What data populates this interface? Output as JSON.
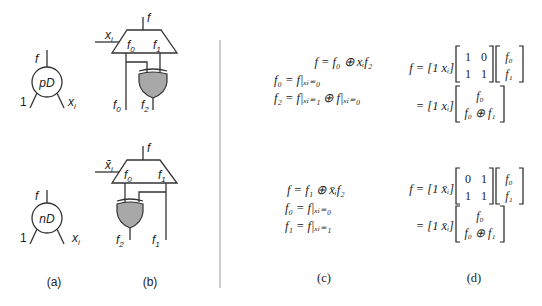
{
  "figure": {
    "panel_labels": {
      "a": "(a)",
      "b": "(b)",
      "c": "(c)",
      "d": "(d)"
    },
    "colors": {
      "gate_fill": "#a8a8a8",
      "line": "#333333",
      "divider": "#999999"
    },
    "panel_a": {
      "top_node": {
        "label": "pD",
        "output": "f",
        "left_input": "1",
        "right_input": "x",
        "right_input_sub": "i"
      },
      "bottom_node": {
        "label": "nD",
        "output": "f",
        "left_input": "1",
        "right_input": "x",
        "right_input_sub": "i"
      }
    },
    "panel_b": {
      "top": {
        "output": "f",
        "select": "x",
        "select_sub": "i",
        "mux_in0": "f",
        "mux_in0_sub": "0",
        "mux_in1": "f",
        "mux_in1_sub": "1",
        "out_left": "f",
        "out_left_sub": "0",
        "out_right": "f",
        "out_right_sub": "2",
        "gate": "xor"
      },
      "bottom": {
        "output": "f",
        "select": "x̄",
        "select_sub": "i",
        "mux_in0": "f",
        "mux_in0_sub": "0",
        "mux_in1": "f",
        "mux_in1_sub": "1",
        "out_left": "f",
        "out_left_sub": "2",
        "out_right": "f",
        "out_right_sub": "1",
        "gate": "xor"
      }
    },
    "panel_c": {
      "top": [
        "f = f₀ ⊕ xᵢf₂",
        "f₀ = f|ₓᵢ₌₀",
        "f₂ = f|ₓᵢ₌₁ ⊕ f|ₓᵢ₌₀"
      ],
      "bottom": [
        "f = f₁ ⊕ x̄ᵢf₂",
        "f₀ = f|ₓᵢ₌₀",
        "f₁ = f|ₓᵢ₌₁"
      ]
    },
    "panel_d": {
      "top": {
        "lhs": "f = [1 xᵢ]",
        "matrix": [
          [
            "1",
            "0"
          ],
          [
            "1",
            "1"
          ]
        ],
        "vector": [
          "f₀",
          "f₁"
        ],
        "line2_lhs": "= [1 xᵢ]",
        "result": [
          "f₀",
          "f₀ ⊕ f₁"
        ]
      },
      "bottom": {
        "lhs": "f = [1 x̄ᵢ]",
        "matrix": [
          [
            "0",
            "1"
          ],
          [
            "1",
            "1"
          ]
        ],
        "vector": [
          "f₀",
          "f₁"
        ],
        "line2_lhs": "= [1 x̄ᵢ]",
        "result": [
          "f₀",
          "f₀ ⊕ f₁"
        ]
      }
    }
  }
}
